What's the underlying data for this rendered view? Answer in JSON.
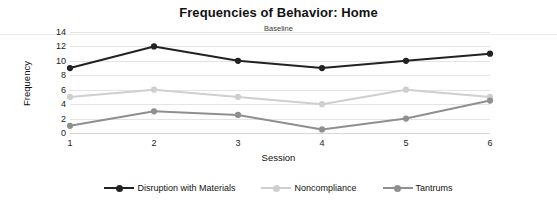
{
  "chart_data": {
    "type": "line",
    "title": "Frequencies of Behavior: Home",
    "subtitle": "Baseline",
    "xlabel": "Session",
    "ylabel": "Frequency",
    "categories": [
      "1",
      "2",
      "3",
      "4",
      "5",
      "6"
    ],
    "x": [
      1,
      2,
      3,
      4,
      5,
      6
    ],
    "ylim": [
      0,
      14
    ],
    "yticks": [
      "0",
      "2",
      "4",
      "6",
      "8",
      "10",
      "12",
      "14"
    ],
    "ytick_values": [
      0,
      2,
      4,
      6,
      8,
      10,
      12,
      14
    ],
    "grid": true,
    "legend_position": "bottom",
    "series": [
      {
        "name": "Disruption with Materials",
        "color": "#222222",
        "values": [
          9,
          12,
          10,
          9,
          10,
          11
        ]
      },
      {
        "name": "Noncompliance",
        "color": "#cfcfcf",
        "values": [
          5,
          6,
          5,
          4,
          6,
          5
        ]
      },
      {
        "name": "Tantrums",
        "color": "#8f8f8f",
        "values": [
          1,
          3,
          2.5,
          0.5,
          2,
          4.5
        ]
      }
    ]
  },
  "legend": {
    "items": [
      {
        "label": "Disruption with Materials"
      },
      {
        "label": "Noncompliance"
      },
      {
        "label": "Tantrums"
      }
    ]
  },
  "colors": {
    "series_dark": "#222222",
    "series_light": "#cfcfcf",
    "series_medium": "#8f8f8f",
    "gridline": "#e4e4e4",
    "background": "#ffffff"
  }
}
